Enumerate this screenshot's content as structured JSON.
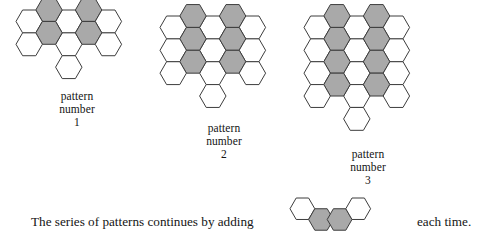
{
  "document": {
    "kind": "math-worksheet-figure",
    "topic": "hexagon pattern sequence"
  },
  "colors": {
    "shaded_fill": "#a9a9a9",
    "unshaded_fill": "#ffffff",
    "outline": "#3d3d3d",
    "text": "#141414",
    "background": "#ffffff"
  },
  "geometry": {
    "hex_radius": 13.2,
    "hex_radius_small": 12.4,
    "orientation": "pointy-left-right-flat-top-bottom"
  },
  "patterns": [
    {
      "id": "pattern-1",
      "caption_line_1": "pattern",
      "caption_line_2": "number",
      "caption_line_3": "1",
      "number": 1,
      "origin": {
        "x": 14,
        "y": 8
      },
      "caption_top": 90,
      "caption_left": 14,
      "caption_width": 126,
      "total_hexagons": 12,
      "shaded_count": 4,
      "cells": [
        {
          "col": 2,
          "row": 0,
          "shaded": false
        },
        {
          "col": 1,
          "row": 0,
          "shaded": true
        },
        {
          "col": 3,
          "row": 0,
          "shaded": true
        },
        {
          "col": 0,
          "row": 0,
          "shaded": false
        },
        {
          "col": 4,
          "row": 0,
          "shaded": false
        },
        {
          "col": 2,
          "row": 1,
          "shaded": false
        },
        {
          "col": 1,
          "row": 1,
          "shaded": true
        },
        {
          "col": 3,
          "row": 1,
          "shaded": true
        },
        {
          "col": 0,
          "row": 1,
          "shaded": false
        },
        {
          "col": 4,
          "row": 1,
          "shaded": false
        },
        {
          "col": 2,
          "row": 2,
          "shaded": false
        }
      ]
    },
    {
      "id": "pattern-2",
      "caption_line_1": "pattern",
      "caption_line_2": "number",
      "caption_line_3": "2",
      "number": 2,
      "origin": {
        "x": 158,
        "y": 14
      },
      "caption_top": 122,
      "caption_left": 158,
      "caption_width": 132,
      "total_hexagons": 19,
      "shaded_count": 6,
      "cells": [
        {
          "col": 2,
          "row": 0,
          "shaded": false
        },
        {
          "col": 1,
          "row": 0,
          "shaded": true
        },
        {
          "col": 3,
          "row": 0,
          "shaded": true
        },
        {
          "col": 0,
          "row": 0,
          "shaded": false
        },
        {
          "col": 4,
          "row": 0,
          "shaded": false
        },
        {
          "col": 2,
          "row": 1,
          "shaded": false
        },
        {
          "col": 1,
          "row": 1,
          "shaded": true
        },
        {
          "col": 3,
          "row": 1,
          "shaded": true
        },
        {
          "col": 0,
          "row": 1,
          "shaded": false
        },
        {
          "col": 4,
          "row": 1,
          "shaded": false
        },
        {
          "col": 2,
          "row": 2,
          "shaded": false
        },
        {
          "col": 1,
          "row": 2,
          "shaded": true
        },
        {
          "col": 3,
          "row": 2,
          "shaded": true
        },
        {
          "col": 0,
          "row": 2,
          "shaded": false
        },
        {
          "col": 4,
          "row": 2,
          "shaded": false
        },
        {
          "col": 2,
          "row": 3,
          "shaded": false
        }
      ]
    },
    {
      "id": "pattern-3",
      "caption_line_1": "pattern",
      "caption_line_2": "number",
      "caption_line_3": "3",
      "number": 3,
      "origin": {
        "x": 302,
        "y": 14
      },
      "caption_top": 148,
      "caption_left": 302,
      "caption_width": 132,
      "total_hexagons": 26,
      "shaded_count": 8,
      "cells": [
        {
          "col": 2,
          "row": 0,
          "shaded": false
        },
        {
          "col": 1,
          "row": 0,
          "shaded": true
        },
        {
          "col": 3,
          "row": 0,
          "shaded": true
        },
        {
          "col": 0,
          "row": 0,
          "shaded": false
        },
        {
          "col": 4,
          "row": 0,
          "shaded": false
        },
        {
          "col": 2,
          "row": 1,
          "shaded": false
        },
        {
          "col": 1,
          "row": 1,
          "shaded": true
        },
        {
          "col": 3,
          "row": 1,
          "shaded": true
        },
        {
          "col": 0,
          "row": 1,
          "shaded": false
        },
        {
          "col": 4,
          "row": 1,
          "shaded": false
        },
        {
          "col": 2,
          "row": 2,
          "shaded": false
        },
        {
          "col": 1,
          "row": 2,
          "shaded": true
        },
        {
          "col": 3,
          "row": 2,
          "shaded": true
        },
        {
          "col": 0,
          "row": 2,
          "shaded": false
        },
        {
          "col": 4,
          "row": 2,
          "shaded": false
        },
        {
          "col": 2,
          "row": 3,
          "shaded": false
        },
        {
          "col": 1,
          "row": 3,
          "shaded": true
        },
        {
          "col": 3,
          "row": 3,
          "shaded": true
        },
        {
          "col": 0,
          "row": 3,
          "shaded": false
        },
        {
          "col": 4,
          "row": 3,
          "shaded": false
        },
        {
          "col": 2,
          "row": 4,
          "shaded": false
        }
      ]
    }
  ],
  "sentence": {
    "lead_text": "The series of patterns continues by adding",
    "tail_text": "each time."
  },
  "addend_figure": {
    "id": "addend-figure",
    "description": "four-hexagon increment piece",
    "total_hexagons": 4,
    "shaded_count": 2,
    "cells": [
      {
        "col": 0,
        "row": 0,
        "shaded": false
      },
      {
        "col": 1,
        "row": 0,
        "shaded": true
      },
      {
        "col": 2,
        "row": 0,
        "shaded": true
      },
      {
        "col": 3,
        "row": 0,
        "shaded": false
      }
    ]
  }
}
